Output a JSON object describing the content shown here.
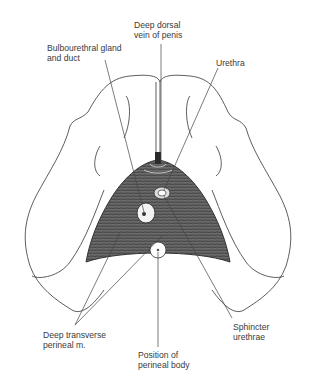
{
  "figure": {
    "colors": {
      "ink": "#333333",
      "muscle": "#5a5a5a",
      "leader": "#444444",
      "background": "#ffffff"
    }
  },
  "labels": {
    "deep_dorsal_vein": {
      "line1": "Deep dorsal",
      "line2": "vein of penis"
    },
    "bulbourethral": {
      "line1": "Bulbourethral gland",
      "line2": "and duct"
    },
    "urethra": {
      "line1": "Urethra"
    },
    "deep_transverse": {
      "line1": "Deep transverse",
      "line2": "perineal m."
    },
    "sphincter": {
      "line1": "Sphincter",
      "line2": "urethrae"
    },
    "perineal_body": {
      "line1": "Position of",
      "line2": "perineal body"
    }
  }
}
